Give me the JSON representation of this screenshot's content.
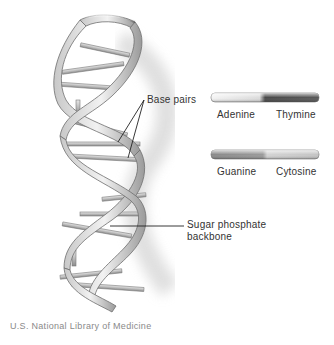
{
  "diagram": {
    "labels": {
      "base_pairs": "Base pairs",
      "sugar_phosphate": "Sugar phosphate",
      "backbone": "backbone"
    },
    "legend": [
      {
        "left": "Adenine",
        "right": "Thymine",
        "left_color": "#f0f0f0",
        "right_color": "#555555"
      },
      {
        "left": "Guanine",
        "right": "Cytosine",
        "left_color": "#8a8a8a",
        "right_color": "#cfcfcf"
      }
    ],
    "credit": "U.S. National Library of Medicine"
  }
}
